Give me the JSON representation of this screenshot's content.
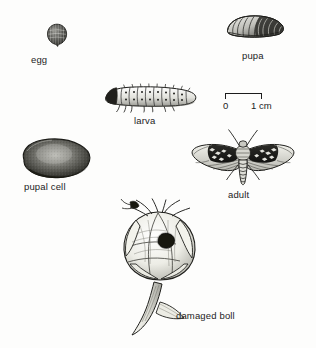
{
  "figure": {
    "kind": "life-cycle-illustration",
    "background_color": "#fdfdfc",
    "ink_color": "#1c1c1c"
  },
  "specimens": [
    {
      "id": "egg",
      "label": "egg",
      "icon": "egg-illustration"
    },
    {
      "id": "pupa",
      "label": "pupa",
      "icon": "pupa-illustration"
    },
    {
      "id": "larva",
      "label": "larva",
      "icon": "larva-illustration"
    },
    {
      "id": "pupal-cell",
      "label": "pupal  cell",
      "icon": "pupal-cell-illustration"
    },
    {
      "id": "adult",
      "label": "adult",
      "icon": "adult-moth-illustration"
    },
    {
      "id": "damaged-boll",
      "label": "damaged boll",
      "icon": "damaged-boll-illustration"
    }
  ],
  "scale": {
    "zero_label": "0",
    "max_label": "1 cm",
    "length_px": 37
  }
}
